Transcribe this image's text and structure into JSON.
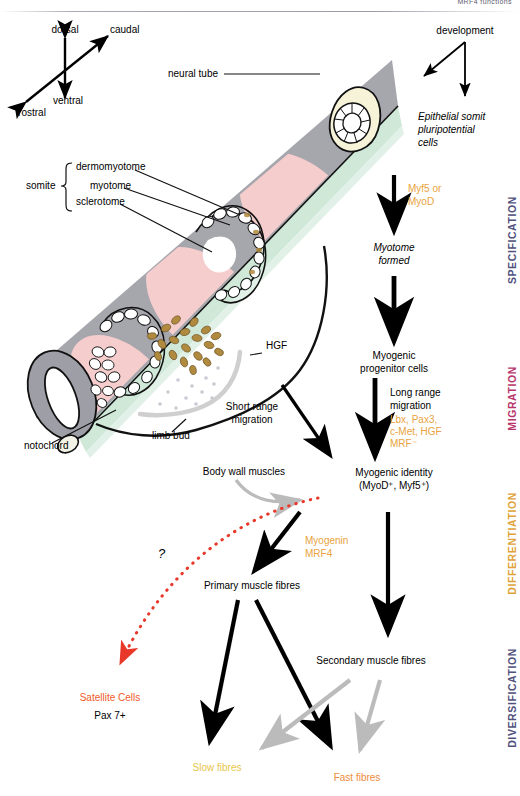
{
  "header": {
    "running_head": "MRF4 functions"
  },
  "colors": {
    "orange": "#e8a33d",
    "orange_label": "#ef8b3c",
    "yellow": "#e8c54a",
    "red": "#e8382a",
    "magenta": "#b8356b",
    "blue": "#51517e",
    "neural_tube_gray": "#9e9ea6",
    "somite_pink": "#f6cdcd",
    "green_band": "#cfe8d8",
    "cell_tan": "#b08a3e",
    "gray_arrow": "#bbbbbb"
  },
  "axes": {
    "dorsal": "dorsal",
    "ventral": "ventral",
    "rostral": "rostral",
    "caudal": "caudal"
  },
  "illustration": {
    "neural_tube": "neural tube",
    "notochord": "notochord",
    "limb_bud": "limb bud",
    "hgf": "HGF",
    "short_range_migration": "Short range\nmigration",
    "somite_bracket": "somite",
    "somite_parts": [
      "dermomyotome",
      "myotome",
      "sclerotome"
    ]
  },
  "flow": {
    "development": "development",
    "epithelial": "Epithelial somit\npluripotential\ncells",
    "myf5_myod": "Myf5 or\nMyoD",
    "myotome_formed": "Myotome\nformed",
    "myogenic_progenitor": "Myogenic\nprogenitor cells",
    "long_range_migration": "Long range\nmigration",
    "migration_genes": "Lbx, Pax3,\nc-Met, HGF\nMRF⁻",
    "myogenic_identity": "Myogenic identity\n(MyoD⁺, Myf5⁺)",
    "body_wall_muscles": "Body wall muscles",
    "myogenin_mrf4": "Myogenin\nMRF4",
    "primary_fibres": "Primary muscle fibres",
    "secondary_fibres": "Secondary muscle fibres",
    "satellite_cells": "Satellite Cells",
    "pax7": "Pax 7+",
    "slow_fibres": "Slow fibres",
    "fast_fibres": "Fast fibres",
    "question_mark": "?"
  },
  "stages": [
    {
      "label": "SPECIFICATION",
      "color": "#51517e"
    },
    {
      "label": "MIGRATION",
      "color": "#b8356b"
    },
    {
      "label": "DIFFERENTIATION",
      "color": "#e0a33a"
    },
    {
      "label": "DIVERSIFICATION",
      "color": "#51517e"
    }
  ]
}
